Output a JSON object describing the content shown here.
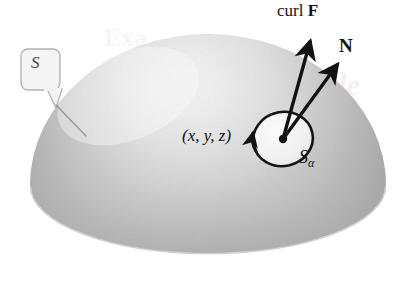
{
  "figure": {
    "background_color": "#ffffff"
  },
  "labels": {
    "curl_f_prefix": "curl ",
    "curl_f_vector": "F",
    "normal_vector": "N",
    "point": "(x, y, z)",
    "patch": "S",
    "patch_subscript": "α",
    "surface": "S"
  },
  "colors": {
    "ink": "#121212",
    "callout_stroke": "#b0b0b0",
    "callout_fill": "#f4f4f4",
    "dome_light": "#f0f0f0",
    "dome_mid": "#d2d2d2",
    "dome_dark": "#a9a9a9",
    "base_light": "#f2f2f2",
    "base_mid": "#dcdcdc",
    "patch_fill": "#efefef",
    "watermark": "#f0dada"
  },
  "geometry": {
    "dome_center_x": 208,
    "dome_equator_y": 186,
    "dome_radius_x": 178,
    "dome_top_y": 34,
    "base_ellipse_ry": 68,
    "patch_center_x": 283,
    "patch_center_y": 139,
    "patch_rx": 30,
    "patch_ry": 27
  },
  "elements": {
    "curl_arrow_name": "curl-f-arrow",
    "normal_arrow_name": "normal-vector-arrow",
    "circulation_arrow_name": "circulation-arrow",
    "callout_name": "surface-label-callout",
    "center_dot_name": "patch-center-point"
  }
}
